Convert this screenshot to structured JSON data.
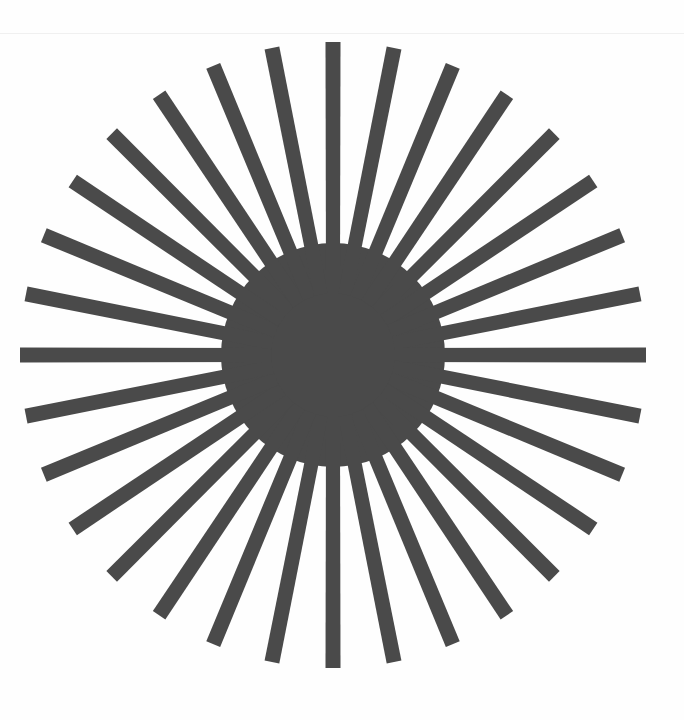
{
  "document": {
    "title": "Starburst",
    "width": 684,
    "height": 720,
    "background_color": "#fefefe",
    "paper_edge_color": "#f0f0f0",
    "paper_edge_y": 33
  },
  "figure": {
    "name": "radial-starburst",
    "fill_color": "#4a4a4a",
    "center_x": 333,
    "center_y": 355,
    "outer_radius": 313,
    "inner_radius": 112,
    "ray_count": 32,
    "angle_step_degrees": 11.25,
    "start_angle_degrees": -90,
    "tip_width": 15,
    "core_radius": 112
  },
  "chart_data": {
    "type": "pie",
    "xlabel": "",
    "ylabel": "",
    "categories": [
      "ray-00",
      "ray-01",
      "ray-02",
      "ray-03",
      "ray-04",
      "ray-05",
      "ray-06",
      "ray-07",
      "ray-08",
      "ray-09",
      "ray-10",
      "ray-11",
      "ray-12",
      "ray-13",
      "ray-14",
      "ray-15",
      "ray-16",
      "ray-17",
      "ray-18",
      "ray-19",
      "ray-20",
      "ray-21",
      "ray-22",
      "ray-23",
      "ray-24",
      "ray-25",
      "ray-26",
      "ray-27",
      "ray-28",
      "ray-29",
      "ray-30",
      "ray-31"
    ],
    "angles_degrees": [
      -90,
      -78.75,
      -67.5,
      -56.25,
      -45,
      -33.75,
      -22.5,
      -11.25,
      0,
      11.25,
      22.5,
      33.75,
      45,
      56.25,
      67.5,
      78.75,
      90,
      101.25,
      112.5,
      123.75,
      135,
      146.25,
      157.5,
      168.75,
      180,
      191.25,
      202.5,
      213.75,
      225,
      236.25,
      247.5,
      258.75
    ],
    "values": [
      313,
      313,
      313,
      313,
      313,
      313,
      313,
      313,
      313,
      313,
      313,
      313,
      313,
      313,
      313,
      313,
      313,
      313,
      313,
      313,
      313,
      313,
      313,
      313,
      313,
      313,
      313,
      313,
      313,
      313,
      313,
      313
    ],
    "inner_radius": 112,
    "colors": [
      "#4a4a4a"
    ],
    "grid": false,
    "legend": "none"
  }
}
